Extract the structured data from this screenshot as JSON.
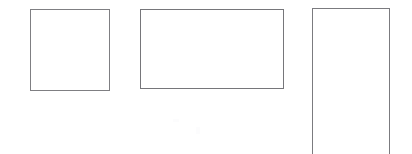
{
  "canvas": {
    "width": 412,
    "height": 154,
    "background_color": "#ffffff",
    "description": "Three empty rectangular outlines on a plain white background"
  },
  "figure": {
    "title": "",
    "caption": "",
    "shape_count": 3,
    "stroke_width_px": 1
  },
  "shapes": [
    {
      "name": "square",
      "label": "",
      "kind": "rectangle",
      "orientation": "square",
      "x": 30,
      "y": 9,
      "width": 80,
      "height": 82,
      "stroke_color": "#7f7f82",
      "fill_color": "transparent",
      "clipped": false
    },
    {
      "name": "landscape-rectangle",
      "label": "",
      "kind": "rectangle",
      "orientation": "landscape",
      "x": 140,
      "y": 9,
      "width": 144,
      "height": 80,
      "stroke_color": "#76767a",
      "fill_color": "transparent",
      "clipped": false
    },
    {
      "name": "portrait-rectangle",
      "label": "",
      "kind": "rectangle",
      "orientation": "portrait",
      "x": 312,
      "y": 8,
      "width": 78,
      "height": 148,
      "stroke_color": "#7b7b7f",
      "fill_color": "transparent",
      "clipped": true
    }
  ]
}
